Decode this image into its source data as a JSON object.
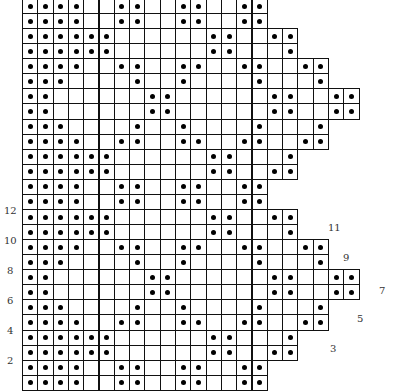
{
  "chart_data": {
    "type": "filet-crochet-grid",
    "grid": {
      "left_px": 22,
      "top_px": -2,
      "cell_w": 15.3,
      "cell_h": 15.07,
      "filled_color": "#000000",
      "line_color": "#111111"
    },
    "row_patterns": {
      "A": {
        "width": 16,
        "filled": [
          1,
          2,
          3,
          4,
          7,
          8,
          11,
          12,
          15,
          16
        ]
      },
      "B": {
        "width": 18,
        "filled": [
          1,
          2,
          3,
          4,
          5,
          6,
          13,
          14,
          17,
          18
        ]
      },
      "C": {
        "width": 18,
        "filled": [
          1,
          2,
          3,
          4,
          5,
          6,
          13,
          14,
          18
        ]
      },
      "D": {
        "width": 20,
        "filled": [
          1,
          2,
          3,
          4,
          7,
          8,
          11,
          12,
          15,
          16,
          19,
          20
        ]
      },
      "E": {
        "width": 20,
        "filled": [
          1,
          2,
          3,
          8,
          11,
          16,
          20
        ]
      },
      "F": {
        "width": 22,
        "filled": [
          1,
          2,
          9,
          10,
          17,
          18,
          21,
          22
        ]
      }
    },
    "rows_top_to_bottom": [
      "A",
      "A",
      "B",
      "C",
      "D",
      "E",
      "F",
      "F",
      "E",
      "D",
      "C",
      "B",
      "A",
      "A",
      "B",
      "C",
      "D",
      "E",
      "F",
      "F",
      "E",
      "D",
      "C",
      "B",
      "A",
      "A"
    ],
    "row_labels_left": [
      {
        "text": "12",
        "x": 4,
        "y": 206
      },
      {
        "text": "10",
        "x": 4,
        "y": 236
      },
      {
        "text": "8",
        "x": 7,
        "y": 266
      },
      {
        "text": "6",
        "x": 7,
        "y": 296
      },
      {
        "text": "4",
        "x": 7,
        "y": 326
      },
      {
        "text": "2",
        "x": 7,
        "y": 356
      }
    ],
    "row_labels_right": [
      {
        "text": "11",
        "x": 328,
        "y": 223
      },
      {
        "text": "9",
        "x": 343,
        "y": 253
      },
      {
        "text": "7",
        "x": 379,
        "y": 286
      },
      {
        "text": "5",
        "x": 357,
        "y": 314
      },
      {
        "text": "3",
        "x": 330,
        "y": 344
      }
    ]
  }
}
